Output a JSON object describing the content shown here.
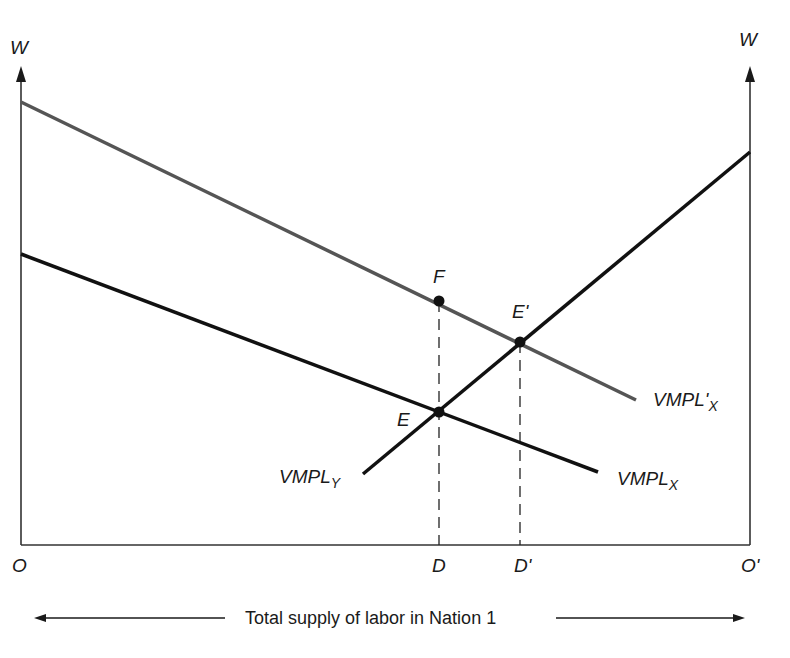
{
  "diagram": {
    "type": "labor-market-two-nation",
    "axes": {
      "left_y_label": "W",
      "right_y_label": "W",
      "origin_left": "O",
      "origin_right": "O'",
      "x_caption": "Total supply of labor in Nation 1"
    },
    "curves": [
      {
        "id": "vmpl_x_prime",
        "label_main": "VMPL'",
        "label_sub": "X",
        "color": "#555555"
      },
      {
        "id": "vmpl_x",
        "label_main": "VMPL",
        "label_sub": "X",
        "color": "#111111"
      },
      {
        "id": "vmpl_y",
        "label_main": "VMPL",
        "label_sub": "Y",
        "color": "#111111"
      }
    ],
    "points": [
      {
        "id": "F",
        "label": "F"
      },
      {
        "id": "E",
        "label": "E"
      },
      {
        "id": "E_prime",
        "label": "E'"
      }
    ],
    "x_markers": [
      {
        "id": "D",
        "label": "D"
      },
      {
        "id": "D_prime",
        "label": "D'"
      }
    ]
  }
}
